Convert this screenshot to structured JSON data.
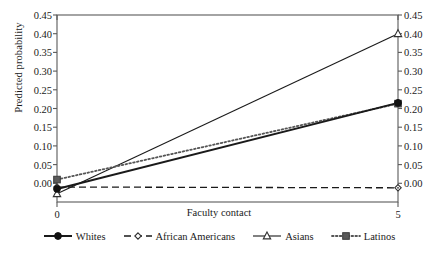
{
  "chart_data": {
    "type": "line",
    "title": "",
    "xlabel": "Faculty contact",
    "ylabel": "Predicted probability",
    "xlim": [
      0,
      5
    ],
    "ylim": [
      -0.05,
      0.45
    ],
    "xticks": [
      0,
      5
    ],
    "xticklabels": [
      "0",
      "5"
    ],
    "yticks": [
      0.0,
      0.05,
      0.1,
      0.15,
      0.2,
      0.25,
      0.3,
      0.35,
      0.4,
      0.45
    ],
    "yticklabels": [
      "0.00",
      "0.05",
      "0.10",
      "0.15",
      "0.20",
      "0.25",
      "0.30",
      "0.35",
      "0.40",
      "0.45"
    ],
    "right_axis": true,
    "right_yticklabels": [
      "0.00",
      "0.05",
      "0.10",
      "0.15",
      "0.20",
      "0.25",
      "0.30",
      "0.35",
      "0.40",
      "0.45"
    ],
    "grid": false,
    "legend_position": "below",
    "x": [
      0,
      5
    ],
    "series": [
      {
        "name": "Whites",
        "values": [
          -0.015,
          0.215
        ],
        "line_style": "solid",
        "marker": "filled-circle",
        "color": "#1a1a1a",
        "line_width": 2.0
      },
      {
        "name": "African Americans",
        "values": [
          -0.01,
          -0.012
        ],
        "line_style": "dashed",
        "marker": "open-diamond",
        "color": "#1a1a1a",
        "line_width": 1.3
      },
      {
        "name": "Asians",
        "values": [
          -0.028,
          0.4
        ],
        "line_style": "solid",
        "marker": "open-triangle",
        "color": "#1a1a1a",
        "line_width": 1.1
      },
      {
        "name": "Latinos",
        "values": [
          0.01,
          0.213
        ],
        "line_style": "dotted",
        "marker": "filled-square",
        "color": "#555555",
        "line_width": 1.8
      }
    ]
  },
  "legend": {
    "items": [
      {
        "label": "Whites",
        "marker": "filled-circle",
        "line_style": "solid"
      },
      {
        "label": "African Americans",
        "marker": "open-diamond",
        "line_style": "dashed"
      },
      {
        "label": "Asians",
        "marker": "open-triangle",
        "line_style": "solid"
      },
      {
        "label": "Latinos",
        "marker": "filled-square",
        "line_style": "dotted"
      }
    ]
  },
  "axes": {
    "frame_color": "#5a5a5a",
    "text_color": "#1a1a1a"
  }
}
